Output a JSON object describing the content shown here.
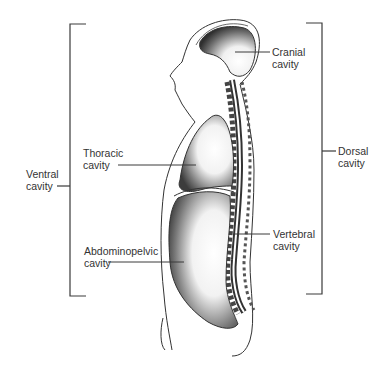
{
  "diagram": {
    "labels": {
      "cranial": {
        "line1": "Cranial",
        "line2": "cavity"
      },
      "thoracic": {
        "line1": "Thoracic",
        "line2": "cavity"
      },
      "ventral": {
        "line1": "Ventral",
        "line2": "cavity"
      },
      "abdominopelvic": {
        "line1": "Abdominopelvic",
        "line2": "cavity"
      },
      "vertebral": {
        "line1": "Vertebral",
        "line2": "cavity"
      },
      "dorsal": {
        "line1": "Dorsal",
        "line2": "cavity"
      }
    },
    "brackets": {
      "ventral": {
        "side": "left",
        "x": 70,
        "top": 24,
        "bottom": 296
      },
      "dorsal": {
        "side": "right",
        "x": 322,
        "top": 23,
        "bottom": 294
      }
    },
    "colors": {
      "line": "#3a3a3a",
      "shading": "#555555",
      "background": "#ffffff"
    }
  }
}
